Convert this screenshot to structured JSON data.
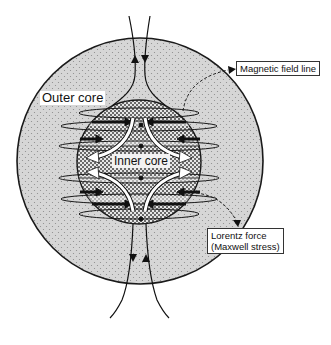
{
  "figure": {
    "labels": {
      "outer_core": "Outer core",
      "inner_core": "Inner core",
      "magnetic_field_line": "Magnetic field line",
      "lorentz_force_line1": "Lorentz force",
      "lorentz_force_line2": "(Maxwell stress)"
    },
    "colors": {
      "outer_core_fill": "#d4d4d4",
      "inner_core_fill": "#bdbdbd",
      "stroke": "#1a1a1a",
      "background": "#ffffff"
    },
    "geometry": {
      "outer_core": {
        "cx": 140,
        "cy": 161,
        "r": 123
      },
      "inner_core": {
        "cx": 139,
        "cy": 162,
        "r": 62
      }
    }
  }
}
